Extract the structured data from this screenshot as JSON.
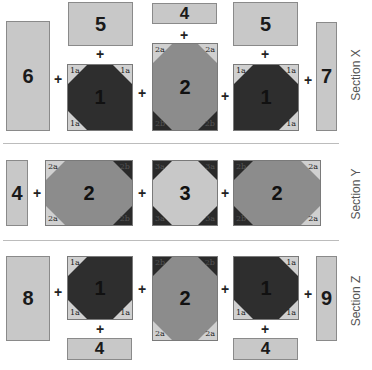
{
  "colors": {
    "light": "#c8c8c8",
    "medium": "#8c8c8c",
    "dark": "#2e2e2e",
    "corner_light": "#d0d0d0",
    "corner_dark": "#2a2a2a"
  },
  "plus": "+",
  "sections": {
    "x": {
      "label": "Section X",
      "pieces": {
        "p6": "6",
        "p5a": "5",
        "p4": "4",
        "p5b": "5",
        "p7": "7"
      },
      "blocks": {
        "b1a": {
          "num": "1",
          "tl": "1a",
          "tr": "1a",
          "bl": "1a",
          "br": ""
        },
        "b2": {
          "num": "2",
          "tl": "2a",
          "tr": "2a",
          "bl": "2b",
          "br": "2b"
        },
        "b1b": {
          "num": "1",
          "tl": "1a",
          "tr": "1a",
          "bl": "",
          "br": "1a"
        }
      }
    },
    "y": {
      "label": "Section Y",
      "pieces": {
        "p4": "4"
      },
      "blocks": {
        "b2a": {
          "num": "2",
          "tl": "2a",
          "tr": "2b",
          "bl": "2a",
          "br": "2b"
        },
        "b3": {
          "num": "3",
          "tl": "3a",
          "tr": "3a",
          "bl": "3a",
          "br": "3a"
        },
        "b2b": {
          "num": "2",
          "tl": "2b",
          "tr": "2a",
          "bl": "2b",
          "br": "2a"
        }
      }
    },
    "z": {
      "label": "Section Z",
      "pieces": {
        "p8": "8",
        "p9": "9",
        "p4a": "4",
        "p4b": "4"
      },
      "blocks": {
        "b1a": {
          "num": "1",
          "tl": "1a",
          "tr": "",
          "bl": "1a",
          "br": "1a"
        },
        "b2": {
          "num": "2",
          "tl": "2b",
          "tr": "2b",
          "bl": "2a",
          "br": "2a"
        },
        "b1b": {
          "num": "1",
          "tl": "",
          "tr": "1a",
          "bl": "1a",
          "br": "1a"
        }
      }
    }
  }
}
